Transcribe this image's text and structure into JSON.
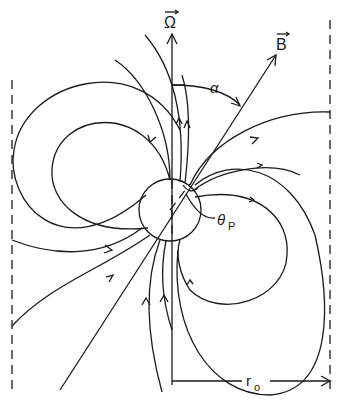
{
  "figure": {
    "type": "magnetic-dipole-field-diagram",
    "colors": {
      "ink": "#1a1a1a",
      "background": "#ffffff"
    }
  },
  "labels": {
    "rotation_axis": "Ω",
    "magnetic_axis": "B",
    "inclination_angle": "α",
    "polar_cap_angle": "θ",
    "polar_cap_subscript": "P",
    "light_cylinder_radius": "r",
    "light_cylinder_subscript": "o"
  },
  "elements": {
    "rotation_axis_vector": "vertical arrow labelled Ω",
    "magnetic_axis_vector": "inclined arrow labelled B",
    "star": "circle at center",
    "light_cylinder": "two vertical dashed lines",
    "radius_marker": "horizontal arrow from rotation axis to right dashed line labelled r0"
  }
}
